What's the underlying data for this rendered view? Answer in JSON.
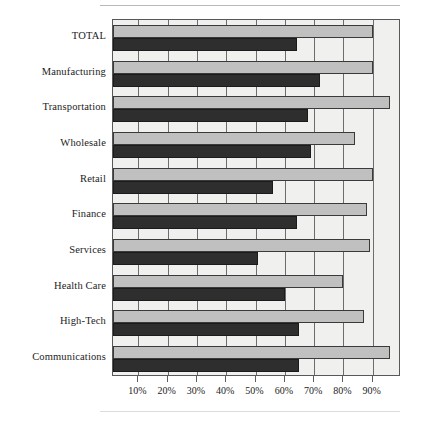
{
  "chart_data": {
    "type": "bar",
    "orientation": "horizontal",
    "title": "",
    "subtitle": "",
    "xlabel": "",
    "ylabel": "",
    "xlim": [
      0,
      98
    ],
    "grid": true,
    "legend_position": "none",
    "categories": [
      "TOTAL",
      "Manufacturing",
      "Transportation",
      "Wholesale",
      "Retail",
      "Finance",
      "Services",
      "Health Care",
      "High-Tech",
      "Communications"
    ],
    "tick_labels": [
      "10%",
      "20%",
      "30%",
      "40%",
      "50%",
      "60%",
      "70%",
      "80%",
      "90%"
    ],
    "tick_values": [
      10,
      20,
      30,
      40,
      50,
      60,
      70,
      80,
      90
    ],
    "series": [
      {
        "name": "upper-series",
        "color": "#c0c0c0",
        "values": [
          90,
          90,
          96,
          84,
          90,
          88,
          89,
          80,
          87,
          96
        ]
      },
      {
        "name": "lower-series",
        "color": "#2e2e2e",
        "values": [
          64,
          72,
          68,
          69,
          56,
          64,
          51,
          60,
          65,
          65
        ]
      }
    ]
  },
  "axis_colors": {
    "frame": "#58585a",
    "gridline": "#6d6d6f",
    "plot_background": "#f0f0ee",
    "bar_upper": "#c0c0c0",
    "bar_lower": "#2e2e2e"
  }
}
